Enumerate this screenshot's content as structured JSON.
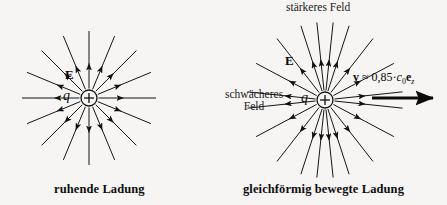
{
  "figure": {
    "title_hidden": "",
    "background_color": "#f6f5f3",
    "ink_color": "#111111"
  },
  "left_panel": {
    "caption": "ruhende Ladung",
    "charge_symbol": "q",
    "charge_sign": "+",
    "field_symbol": "E",
    "center": {
      "x": 89,
      "y": 98
    },
    "charge_radius": 8,
    "ray_count": 16,
    "ray_length": 67,
    "arrow_direction": "outward"
  },
  "right_panel": {
    "caption": "gleichförmig bewegte Ladung",
    "charge_symbol": "q",
    "charge_sign": "+",
    "field_symbol": "E",
    "label_stronger_field": "stärkeres Feld",
    "label_weaker_field_line1": "schwächeres",
    "label_weaker_field_line2": "Feld",
    "center": {
      "x": 325,
      "y": 100
    },
    "charge_radius": 8,
    "ray_count": 16,
    "ray_length": 78,
    "arrow_direction": "outward",
    "velocity": {
      "vector_symbol": "v",
      "relation": "≈",
      "coefficient": "0,85",
      "dot": "·",
      "speed_symbol": "c",
      "speed_subscript": "0",
      "unit_vector": "e",
      "unit_subscript": "z",
      "formula_plain": "v ≈ 0,85 · c0 ez",
      "arrow_from_x": 372,
      "arrow_to_x": 437,
      "arrow_y": 98
    }
  },
  "chart_data": {
    "type": "diagram",
    "panels": [
      {
        "name": "ruhende Ladung",
        "description": "Radialsymmetrisches Coulomb-Feld einer ruhenden Punktladung",
        "ray_angles_deg": [
          0,
          22.5,
          45,
          67.5,
          90,
          112.5,
          135,
          157.5,
          180,
          202.5,
          225,
          247.5,
          270,
          292.5,
          315,
          337.5
        ],
        "field_isotropic": true
      },
      {
        "name": "gleichförmig bewegte Ladung",
        "description": "Feld zur Bewegungsrichtung hin verdichtet, längs der Bewegungsrichtung ausgedünnt",
        "velocity_fraction_of_c": 0.85,
        "ray_angles_deg": [
          6,
          28,
          52,
          72,
          84,
          96,
          108,
          128,
          152,
          174,
          186,
          208,
          232,
          252,
          264,
          276,
          288,
          308,
          332,
          354
        ],
        "field_isotropic": false,
        "stronger_field_direction": "transversal (senkrecht zur Bewegung)",
        "weaker_field_direction": "longitudinal (in Bewegungsrichtung)"
      }
    ]
  }
}
